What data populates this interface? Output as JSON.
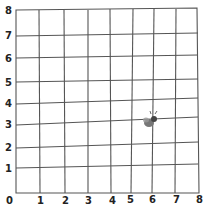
{
  "grid": {
    "x_min": 0,
    "x_max": 8,
    "y_min": 0,
    "y_max": 8,
    "x_labels": [
      "0",
      "1",
      "2",
      "3",
      "4",
      "5",
      "6",
      "7",
      "8"
    ],
    "y_labels": [
      "1",
      "2",
      "3",
      "4",
      "5",
      "6",
      "7",
      "8"
    ],
    "line_color": "#555555"
  },
  "marker": {
    "icon": "fly-icon",
    "x": 5.8,
    "y": 3.2,
    "color": "#666666"
  }
}
